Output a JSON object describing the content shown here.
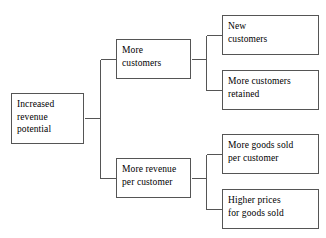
{
  "diagram": {
    "type": "tree",
    "orientation": "left-to-right",
    "background_color": "#ffffff",
    "box_border_color": "#555555",
    "connector_color": "#555555",
    "text_color": "#000000",
    "nodes": {
      "root": {
        "label": "Increased\nrevenue\npotential"
      },
      "branch_1": {
        "label": "More\ncustomers"
      },
      "branch_2": {
        "label": "More revenue\nper customer"
      },
      "leaf_1": {
        "label": "New\ncustomers"
      },
      "leaf_2": {
        "label": "More customers\nretained"
      },
      "leaf_3": {
        "label": "More goods sold\nper customer"
      },
      "leaf_4": {
        "label": "Higher prices\nfor goods sold"
      }
    }
  }
}
